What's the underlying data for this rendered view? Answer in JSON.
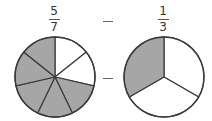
{
  "operation": "subtraction",
  "operator_symbol": "−",
  "left_fraction": {
    "numerator": "5",
    "denominator": "7",
    "shaded_slices": 5,
    "total_slices": 7
  },
  "right_fraction": {
    "numerator": "1",
    "denominator": "3",
    "shaded_slices": 1,
    "total_slices": 3
  },
  "colors": {
    "shaded": "#a6a6a6",
    "unshaded": "#ffffff",
    "outline": "#3a3a3a"
  }
}
